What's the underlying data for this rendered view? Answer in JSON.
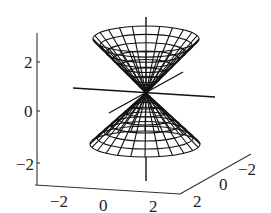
{
  "chart_data": {
    "type": "surface3d",
    "title": "",
    "surface": "double cone z^2 = x^2 + y^2",
    "xlabel": "",
    "ylabel": "",
    "zlabel": "",
    "x_ticks": [
      "-2",
      "0",
      "2"
    ],
    "y_ticks": [
      "2",
      "0",
      "-2"
    ],
    "z_ticks": [
      "2",
      "0",
      "-2"
    ],
    "xlim": [
      -3,
      3
    ],
    "ylim": [
      -3,
      3
    ],
    "zlim": [
      -3,
      3
    ],
    "mesh": {
      "radial_lines": 24,
      "rings": 8
    },
    "cone_apex": [
      0,
      0,
      0
    ],
    "cone_height": 2.5,
    "through_axes": true,
    "box": false,
    "colors": {
      "line": "#111111",
      "frame": "#333333",
      "background": "#ffffff"
    }
  },
  "axes": {
    "z_ticks": [
      {
        "label": "2",
        "x": 24,
        "y": 68
      },
      {
        "label": "0",
        "x": 24,
        "y": 117
      },
      {
        "label": "−2",
        "x": 16,
        "y": 170
      }
    ],
    "x_ticks": [
      {
        "label": "−2",
        "x": 50,
        "y": 207
      },
      {
        "label": "0",
        "x": 99,
        "y": 211
      },
      {
        "label": "2",
        "x": 149,
        "y": 212
      }
    ],
    "y_ticks": [
      {
        "label": "2",
        "x": 193,
        "y": 207
      },
      {
        "label": "0",
        "x": 219,
        "y": 190
      },
      {
        "label": "−2",
        "x": 238,
        "y": 175
      }
    ]
  },
  "geometry": {
    "apex": [
      146,
      93
    ],
    "upper_rim": {
      "cx": 146,
      "cy": 39,
      "rx": 53,
      "ry": 13
    },
    "lower_rim": {
      "cx": 145,
      "cy": 144,
      "rx": 55,
      "ry": 13
    },
    "frame": {
      "vertical": [
        [
          37,
          33
        ],
        [
          37,
          185
        ]
      ],
      "bottom": [
        [
          35,
          185
        ],
        [
          180,
          194
        ]
      ],
      "depth": [
        [
          180,
          194
        ],
        [
          251,
          154
        ]
      ]
    },
    "lines": [
      [
        [
          146,
          17
        ],
        [
          146,
          45
        ]
      ],
      [
        [
          146,
          157
        ],
        [
          146,
          181
        ]
      ],
      [
        [
          73,
          88
        ],
        [
          215,
          97
        ]
      ],
      [
        [
          109,
          113
        ],
        [
          183,
          72
        ]
      ]
    ]
  }
}
